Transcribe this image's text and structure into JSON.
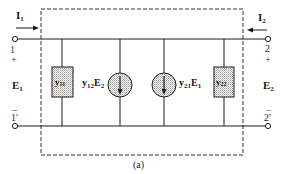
{
  "figure": {
    "caption": "(a)"
  },
  "port1": {
    "current": {
      "symbol": "I",
      "sub": "1"
    },
    "voltage": {
      "symbol": "E",
      "sub": "1"
    },
    "terminal_top": "1",
    "terminal_bottom": "1′",
    "sign_top": "+",
    "sign_bottom": "−"
  },
  "port2": {
    "current": {
      "symbol": "I",
      "sub": "2"
    },
    "voltage": {
      "symbol": "E",
      "sub": "2"
    },
    "terminal_top": "2",
    "terminal_bottom": "2′",
    "sign_top": "+",
    "sign_bottom": "−"
  },
  "components": {
    "y11": {
      "symbol": "y",
      "sub": "11"
    },
    "y22": {
      "symbol": "y",
      "sub": "22"
    },
    "src12": {
      "coef": "y",
      "coef_sub": "12",
      "var": "E",
      "var_sub": "2"
    },
    "src21": {
      "coef": "y",
      "coef_sub": "21",
      "var": "E",
      "var_sub": "1"
    }
  },
  "colors": {
    "line": "#1a1a1a",
    "fill_pattern": "#b8b8b8",
    "background": "#ffffff"
  }
}
